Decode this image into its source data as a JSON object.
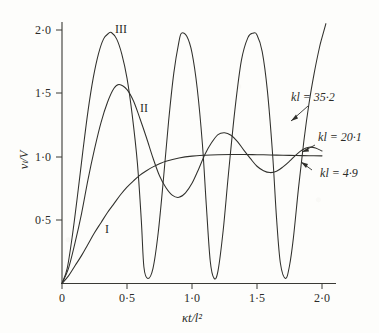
{
  "chart_data": {
    "type": "line",
    "title": "",
    "xlabel": "κt/l²",
    "ylabel": "vₗ/V",
    "xlim": [
      0,
      2.1
    ],
    "ylim": [
      0,
      2.1
    ],
    "grid": false,
    "legend_position": "inline-right",
    "xticks": [
      "0",
      "0·5",
      "1·0",
      "1·5",
      "2·0"
    ],
    "xtick_values": [
      0,
      0.5,
      1.0,
      1.5,
      2.0
    ],
    "yticks": [
      "0·5",
      "1·0",
      "1·5",
      "2·0"
    ],
    "ytick_values": [
      0.5,
      1.0,
      1.5,
      2.0
    ],
    "series": [
      {
        "name": "I",
        "label": "kl = 4·9",
        "parameter": "kl",
        "parameter_value": 4.9,
        "description": "monotonic rise, asymptotes to 1·0",
        "x": [
          0,
          0.05,
          0.1,
          0.15,
          0.2,
          0.25,
          0.3,
          0.35,
          0.4,
          0.45,
          0.5,
          0.55,
          0.6,
          0.65,
          0.7,
          0.75,
          0.8,
          0.9,
          1.0,
          1.1,
          1.2,
          1.3,
          1.4,
          1.5,
          1.6,
          1.7,
          1.8,
          1.9,
          2.0
        ],
        "y": [
          0,
          0.06,
          0.14,
          0.22,
          0.31,
          0.4,
          0.48,
          0.56,
          0.63,
          0.7,
          0.76,
          0.81,
          0.855,
          0.89,
          0.92,
          0.945,
          0.965,
          0.99,
          1.005,
          1.012,
          1.016,
          1.018,
          1.018,
          1.016,
          1.014,
          1.012,
          1.01,
          1.008,
          1.007
        ]
      },
      {
        "name": "II",
        "label": "kl = 20·1",
        "parameter": "kl",
        "parameter_value": 20.1,
        "description": "damped oscillation, first peak 1·57 at 0·44",
        "x": [
          0,
          0.05,
          0.1,
          0.15,
          0.2,
          0.25,
          0.3,
          0.35,
          0.4,
          0.44,
          0.5,
          0.55,
          0.6,
          0.65,
          0.7,
          0.75,
          0.8,
          0.85,
          0.9,
          0.95,
          1.0,
          1.05,
          1.1,
          1.15,
          1.2,
          1.25,
          1.3,
          1.35,
          1.4,
          1.45,
          1.5,
          1.55,
          1.6,
          1.65,
          1.7,
          1.75,
          1.8,
          1.85,
          1.9,
          1.95,
          2.0
        ],
        "y": [
          0,
          0.12,
          0.32,
          0.55,
          0.82,
          1.06,
          1.27,
          1.43,
          1.54,
          1.57,
          1.53,
          1.44,
          1.3,
          1.15,
          0.99,
          0.85,
          0.755,
          0.695,
          0.68,
          0.715,
          0.79,
          0.9,
          1.02,
          1.11,
          1.175,
          1.19,
          1.17,
          1.12,
          1.05,
          0.985,
          0.925,
          0.89,
          0.875,
          0.885,
          0.92,
          0.965,
          1.015,
          1.055,
          1.075,
          1.07,
          1.045
        ]
      },
      {
        "name": "III",
        "label": "kl = 35·2",
        "parameter": "kl",
        "parameter_value": 35.2,
        "description": "large-amplitude oscillation between ~0 and ~2·0",
        "x": [
          0,
          0.04,
          0.08,
          0.12,
          0.16,
          0.2,
          0.24,
          0.28,
          0.32,
          0.36,
          0.38,
          0.42,
          0.46,
          0.5,
          0.54,
          0.58,
          0.61,
          0.63,
          0.66,
          0.7,
          0.74,
          0.78,
          0.82,
          0.86,
          0.9,
          0.92,
          0.96,
          1.0,
          1.04,
          1.08,
          1.11,
          1.14,
          1.17,
          1.2,
          1.24,
          1.28,
          1.33,
          1.38,
          1.43,
          1.47,
          1.5,
          1.54,
          1.58,
          1.62,
          1.65,
          1.68,
          1.72,
          1.75,
          1.78,
          1.82,
          1.86,
          1.9,
          1.94,
          1.98,
          2.0,
          2.03
        ],
        "y": [
          0,
          0.12,
          0.38,
          0.7,
          1.04,
          1.36,
          1.62,
          1.81,
          1.93,
          1.975,
          1.98,
          1.93,
          1.81,
          1.62,
          1.33,
          0.95,
          0.5,
          0.13,
          0.04,
          0.12,
          0.4,
          0.82,
          1.28,
          1.66,
          1.91,
          1.975,
          1.95,
          1.82,
          1.54,
          1.1,
          0.62,
          0.18,
          0.04,
          0.1,
          0.42,
          0.86,
          1.37,
          1.76,
          1.94,
          1.975,
          1.96,
          1.83,
          1.52,
          1.02,
          0.52,
          0.16,
          0.04,
          0.14,
          0.36,
          0.76,
          1.12,
          1.42,
          1.66,
          1.86,
          1.94,
          2.05
        ]
      }
    ],
    "annotations": [
      {
        "text": "kl = 35·2",
        "points_to_series": "III"
      },
      {
        "text": "kl = 20·1",
        "points_to_series": "II"
      },
      {
        "text": "kl = 4·9",
        "points_to_series": "I"
      }
    ],
    "inline_curve_labels": [
      {
        "text": "I",
        "series": "I"
      },
      {
        "text": "II",
        "series": "II"
      },
      {
        "text": "III",
        "series": "III"
      }
    ]
  },
  "axes": {
    "y_title": "vₗ/V",
    "x_title": "κt/l²",
    "x_tick_labels": [
      "0",
      "0·5",
      "1·0",
      "1·5",
      "2·0"
    ],
    "y_tick_labels": [
      "0·5",
      "1·0",
      "1·5",
      "2·0"
    ]
  },
  "labels": {
    "curve_1": "I",
    "curve_2": "II",
    "curve_3": "III",
    "annot_1": "kl = 35·2",
    "annot_2": "kl = 20·1",
    "annot_3": "kl = 4·9"
  },
  "colors": {
    "background": "#fdfdfb",
    "ink": "#30302c",
    "axis": "#3a3a35"
  }
}
